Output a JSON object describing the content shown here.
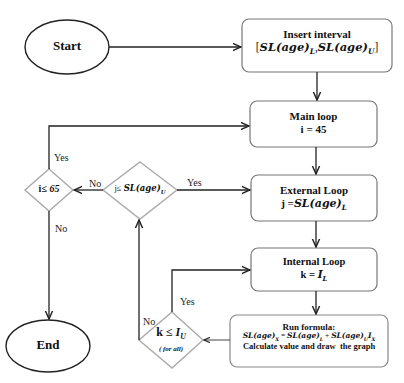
{
  "diagram": {
    "type": "flowchart",
    "colors": {
      "stroke": "#222222",
      "box_stroke": "#777777",
      "diamond_stroke": "#aaaaaa",
      "background": "#ffffff"
    },
    "nodes": {
      "start": {
        "label": "Start",
        "shape": "ellipse"
      },
      "end": {
        "label": "End",
        "shape": "ellipse"
      },
      "insert_interval": {
        "title": "Insert interval",
        "line2_prefix": "[",
        "line2_a": "SL(age)",
        "line2_a_sub": "L",
        "line2_sep": ",",
        "line2_b": "SL(age)",
        "line2_b_sub": "U",
        "line2_suffix": "]",
        "shape": "rounded-rect"
      },
      "main_loop": {
        "title": "Main loop",
        "line2": "i = 45",
        "shape": "rounded-rect"
      },
      "external_loop": {
        "title": "External Loop",
        "line2_prefix": "j =",
        "line2_expr": "SL(age)",
        "line2_sub": "L",
        "shape": "rounded-rect"
      },
      "internal_loop": {
        "title": "Internal Loop",
        "line2_prefix": "k = ",
        "line2_expr": "I",
        "line2_sub": "L",
        "shape": "rounded-rect"
      },
      "run_formula": {
        "title": "Run formula:",
        "formula_lhs": "SL(age)",
        "formula_lhs_sub": "X",
        "formula_eq": " = ",
        "formula_t1": "SL(age)",
        "formula_t1_sub": "L",
        "formula_plus": " + ",
        "formula_t2": "SL(age)",
        "formula_t2_sub": "U",
        "formula_t3": "I",
        "formula_t3_sub": "X",
        "line3": "Calculate value and draw  the graph",
        "shape": "rounded-rect"
      },
      "cond_i": {
        "prefix": "i",
        "op": "≤",
        "value": "65",
        "shape": "diamond"
      },
      "cond_j": {
        "prefix": "j",
        "op": "≤",
        "expr": "SL(age)",
        "sub": "U",
        "shape": "diamond"
      },
      "cond_k": {
        "prefix": "k",
        "op": "≤",
        "expr": "I",
        "sub": "U",
        "note": "( for all)",
        "shape": "diamond"
      }
    },
    "edge_labels": {
      "i_yes": "Yes",
      "i_no": "No",
      "j_yes": "Yes",
      "j_no": "No",
      "k_yes": "Yes",
      "k_no": "No"
    }
  }
}
